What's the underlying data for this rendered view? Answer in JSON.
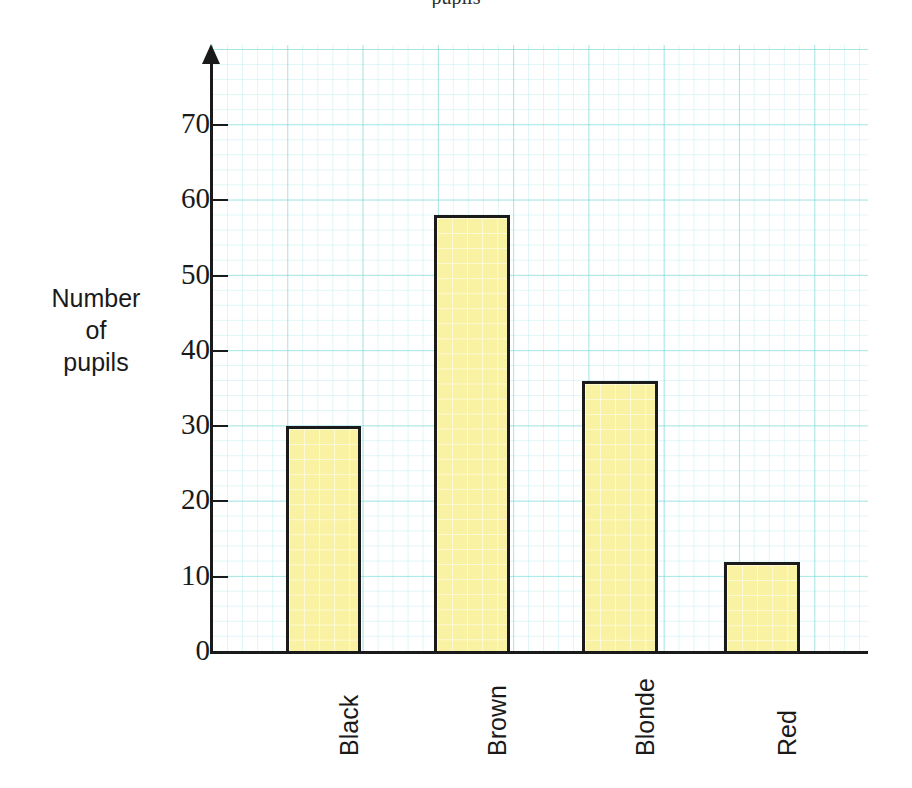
{
  "figure": {
    "partial_heading_above_crop": "pupils",
    "background_color": "#ffffff",
    "grid_color": "#78d7d7"
  },
  "chart_data": {
    "type": "bar",
    "title": "",
    "xlabel": "",
    "ylabel": "Number of pupils",
    "ylabel_lines": [
      "Number",
      "of",
      "pupils"
    ],
    "categories": [
      "Black",
      "Brown",
      "Blonde",
      "Red"
    ],
    "values": [
      30,
      58,
      36,
      12
    ],
    "ylim": [
      0,
      75
    ],
    "yticks": [
      0,
      10,
      20,
      30,
      40,
      50,
      60,
      70
    ],
    "ytick_labels": [
      "0",
      "10",
      "20",
      "30",
      "40",
      "50",
      "60",
      "70"
    ],
    "grid": true,
    "legend": "none",
    "bar_fill_color": "#faf2a3",
    "bar_edge_color": "#1a1a1a",
    "axis_color": "#1a1a1a",
    "y_axis_has_arrow": true
  }
}
